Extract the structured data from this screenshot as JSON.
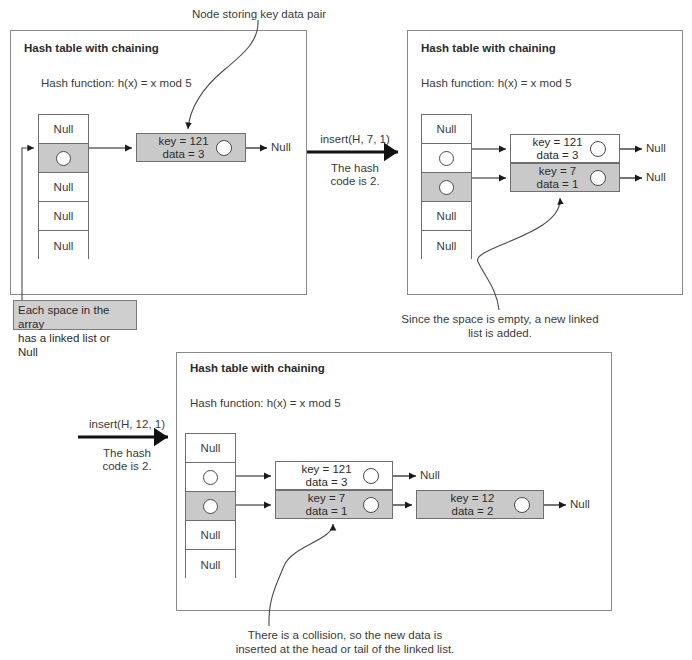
{
  "diagram": {
    "top_caption": "Node storing key data pair",
    "panel_title": "Hash table with chaining",
    "hash_function": "Hash function: h(x) = x mod 5",
    "null_label": "Null",
    "array_note": "Each space in the array\nhas a linked list or Null",
    "steps": [
      {
        "id": "step-1",
        "panel_title": "Hash table with chaining",
        "hash_function": "Hash function: h(x) = x mod 5",
        "buckets": [
          {
            "index": 0,
            "label": "Null",
            "filled": false,
            "highlighted": false
          },
          {
            "index": 1,
            "label": "",
            "filled": true,
            "highlighted": true
          },
          {
            "index": 2,
            "label": "Null",
            "filled": false,
            "highlighted": false
          },
          {
            "index": 3,
            "label": "Null",
            "filled": false,
            "highlighted": false
          },
          {
            "index": 4,
            "label": "Null",
            "filled": false,
            "highlighted": false
          }
        ],
        "chains": [
          {
            "bucket": 1,
            "highlighted": true,
            "nodes": [
              {
                "key_text": "key = 121",
                "data_text": "data = 3",
                "gray": true
              }
            ],
            "tail": "Null"
          }
        ]
      },
      {
        "id": "step-2",
        "panel_title": "Hash table with chaining",
        "hash_function": "Hash function: h(x) = x mod 5",
        "buckets": [
          {
            "index": 0,
            "label": "Null",
            "filled": false,
            "highlighted": false
          },
          {
            "index": 1,
            "label": "",
            "filled": true,
            "highlighted": false
          },
          {
            "index": 2,
            "label": "",
            "filled": true,
            "highlighted": true
          },
          {
            "index": 3,
            "label": "Null",
            "filled": false,
            "highlighted": false
          },
          {
            "index": 4,
            "label": "Null",
            "filled": false,
            "highlighted": false
          }
        ],
        "chains": [
          {
            "bucket": 1,
            "highlighted": false,
            "nodes": [
              {
                "key_text": "key = 121",
                "data_text": "data = 3",
                "gray": false
              }
            ],
            "tail": "Null"
          },
          {
            "bucket": 2,
            "highlighted": true,
            "nodes": [
              {
                "key_text": "key = 7",
                "data_text": "data = 1",
                "gray": true
              }
            ],
            "tail": "Null"
          }
        ],
        "caption": "Since the space is empty, a new linked\nlist is added."
      },
      {
        "id": "step-3",
        "panel_title": "Hash table with chaining",
        "hash_function": "Hash function: h(x) = x mod 5",
        "buckets": [
          {
            "index": 0,
            "label": "Null",
            "filled": false,
            "highlighted": false
          },
          {
            "index": 1,
            "label": "",
            "filled": true,
            "highlighted": false
          },
          {
            "index": 2,
            "label": "",
            "filled": true,
            "highlighted": true
          },
          {
            "index": 3,
            "label": "Null",
            "filled": false,
            "highlighted": false
          },
          {
            "index": 4,
            "label": "Null",
            "filled": false,
            "highlighted": false
          }
        ],
        "chains": [
          {
            "bucket": 1,
            "highlighted": false,
            "nodes": [
              {
                "key_text": "key = 121",
                "data_text": "data = 3",
                "gray": false
              }
            ],
            "tail": "Null"
          },
          {
            "bucket": 2,
            "highlighted": true,
            "nodes": [
              {
                "key_text": "key = 7",
                "data_text": "data = 1",
                "gray": true
              },
              {
                "key_text": "key = 12",
                "data_text": "data = 2",
                "gray": true
              }
            ],
            "tail": "Null"
          }
        ],
        "caption": "There is a collision, so the new data is\ninserted at the head or tail of the linked list."
      }
    ],
    "transitions": [
      {
        "id": "transition-1",
        "op": "insert(H, 7, 1)",
        "note": "The hash\ncode is 2."
      },
      {
        "id": "transition-2",
        "op": "insert(H, 12, 1)",
        "note": "The hash\ncode is 2."
      }
    ],
    "colors": {
      "background": "#ffffff",
      "panel_border": "#8a8a8a",
      "cell_border": "#6f6f6f",
      "highlight_fill": "#c9c9c9",
      "callout_fill": "#cfcfcf",
      "text": "#3b3b3b",
      "arrow": "#1a1a1a"
    }
  }
}
